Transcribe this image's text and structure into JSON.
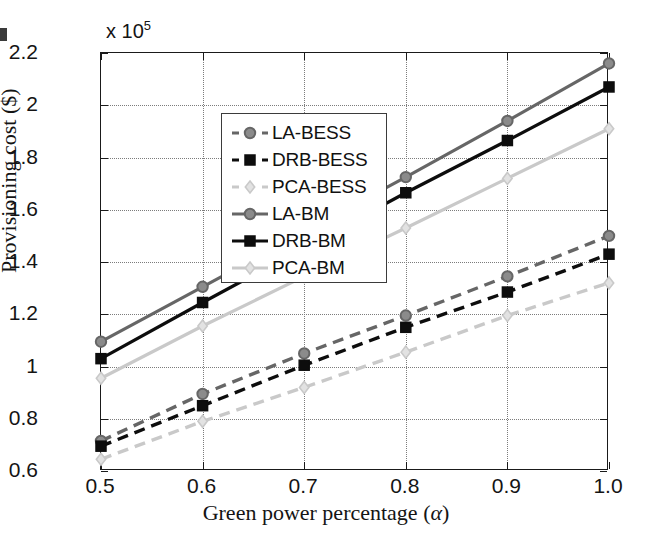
{
  "chart_data": {
    "type": "line",
    "title": "",
    "xlabel": "Green power percentage (α)",
    "ylabel": "Provisioning cost ($)",
    "y_exponent_label": "x 10",
    "y_exponent_value": "5",
    "x": [
      0.5,
      0.6,
      0.7,
      0.8,
      0.9,
      1.0
    ],
    "xticklabels": [
      "0.5",
      "0.6",
      "0.7",
      "0.8",
      "0.9",
      "1.0"
    ],
    "yticks": [
      0.6,
      0.8,
      1.0,
      1.2,
      1.4,
      1.6,
      1.8,
      2.0,
      2.2
    ],
    "yticklabels": [
      "0.6",
      "0.8",
      "1",
      "1.2",
      "1.4",
      "1.6",
      "1.8",
      "2",
      "2.2"
    ],
    "xlim": [
      0.5,
      1.0
    ],
    "ylim": [
      0.6,
      2.2
    ],
    "grid": true,
    "legend_position": "upper left",
    "series": [
      {
        "name": "LA-BESS",
        "values": [
          0.715,
          0.895,
          1.05,
          1.195,
          1.345,
          1.5
        ],
        "color": "#666666",
        "style": "dashed",
        "marker": "circle"
      },
      {
        "name": "DRB-BESS",
        "values": [
          0.695,
          0.85,
          1.005,
          1.15,
          1.285,
          1.43
        ],
        "color": "#0d0d0d",
        "style": "dashed",
        "marker": "square"
      },
      {
        "name": "PCA-BESS",
        "values": [
          0.645,
          0.79,
          0.92,
          1.055,
          1.195,
          1.32
        ],
        "color": "#c9c9c9",
        "style": "dashed",
        "marker": "diamond"
      },
      {
        "name": "LA-BM",
        "values": [
          1.095,
          1.305,
          1.515,
          1.725,
          1.94,
          2.16
        ],
        "color": "#666666",
        "style": "solid",
        "marker": "circle"
      },
      {
        "name": "DRB-BM",
        "values": [
          1.03,
          1.245,
          1.455,
          1.665,
          1.865,
          2.07
        ],
        "color": "#0d0d0d",
        "style": "solid",
        "marker": "square"
      },
      {
        "name": "PCA-BM",
        "values": [
          0.955,
          1.155,
          1.345,
          1.53,
          1.72,
          1.91
        ],
        "color": "#c9c9c9",
        "style": "solid",
        "marker": "diamond"
      }
    ]
  },
  "legend": {
    "items": [
      "LA-BESS",
      "DRB-BESS",
      "PCA-BESS",
      "LA-BM",
      "DRB-BM",
      "PCA-BM"
    ]
  },
  "axis": {
    "y_title": "Provisioning cost ($)",
    "x_title_prefix": "Green power percentage (",
    "x_title_alpha": "α",
    "x_title_suffix": ")",
    "exponent_prefix": "x 10",
    "exponent_sup": "5"
  },
  "colors": {
    "gray": "#666666",
    "black": "#0d0d0d",
    "light": "#c9c9c9",
    "axis": "#1a1a1a",
    "grid": "#7c7c7c"
  }
}
